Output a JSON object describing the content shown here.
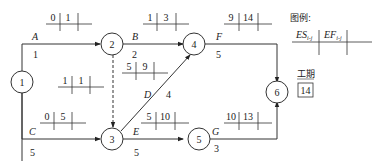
{
  "diagram": {
    "type": "activity-on-arrow network (double-code network diagram)",
    "nodes": [
      {
        "id": "1",
        "label": "1"
      },
      {
        "id": "2",
        "label": "2"
      },
      {
        "id": "3",
        "label": "3"
      },
      {
        "id": "4",
        "label": "4"
      },
      {
        "id": "5",
        "label": "5"
      },
      {
        "id": "6",
        "label": "6"
      }
    ],
    "activities": [
      {
        "name": "A",
        "from": "1",
        "to": "2",
        "duration": "1",
        "ES": "0",
        "EF": "1"
      },
      {
        "name": "B",
        "from": "2",
        "to": "4",
        "duration": "2",
        "ES": "1",
        "EF": "3"
      },
      {
        "name": "C",
        "from": "1",
        "to": "3",
        "duration": "5",
        "ES": "0",
        "EF": "5"
      },
      {
        "name": "D",
        "from": "3",
        "to": "4",
        "duration": "4",
        "ES": "5",
        "EF": "9"
      },
      {
        "name": "E",
        "from": "3",
        "to": "5",
        "duration": "5",
        "ES": "5",
        "EF": "10"
      },
      {
        "name": "F",
        "from": "4",
        "to": "6",
        "duration": "5",
        "ES": "9",
        "EF": "14"
      },
      {
        "name": "G",
        "from": "5",
        "to": "6",
        "duration": "3",
        "ES": "10",
        "EF": "13"
      },
      {
        "name": "dummy",
        "from": "2",
        "to": "3",
        "duration": "",
        "ES": "1",
        "EF": "1"
      }
    ],
    "legend": {
      "title": "图例:",
      "es_label": "ES",
      "es_sub": "i-j",
      "ef_label": "EF",
      "ef_sub": "i-j"
    },
    "duration_box": {
      "label": "工期",
      "value": "14"
    }
  }
}
